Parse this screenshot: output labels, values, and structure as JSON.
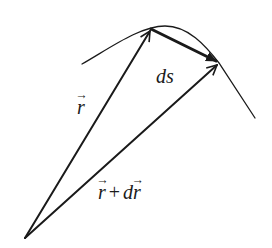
{
  "diagram": {
    "title": "",
    "labels": {
      "r": "r",
      "ds": "ds",
      "r_plus_dr": {
        "r": "r",
        "operator": "+",
        "d": "d",
        "r2": "r"
      }
    },
    "points": {
      "origin": [
        25,
        238
      ],
      "P": [
        151,
        29
      ],
      "Q": [
        219,
        63
      ]
    },
    "elements": [
      {
        "type": "curve",
        "name": "trajectory-curve",
        "description": "path curve through P and Q"
      },
      {
        "type": "arrow",
        "name": "position-vector-r",
        "from": "origin",
        "to": "P",
        "label": "r⃗"
      },
      {
        "type": "arrow",
        "name": "position-vector-r-plus-dr",
        "from": "origin",
        "to": "Q",
        "label": "r⃗ + dr⃗"
      },
      {
        "type": "arrow",
        "name": "arc-length-ds",
        "from": "P",
        "to": "Q",
        "label": "ds",
        "bold": true
      }
    ],
    "colors": {
      "stroke": "#1a1a1a",
      "background": "#ffffff"
    }
  }
}
